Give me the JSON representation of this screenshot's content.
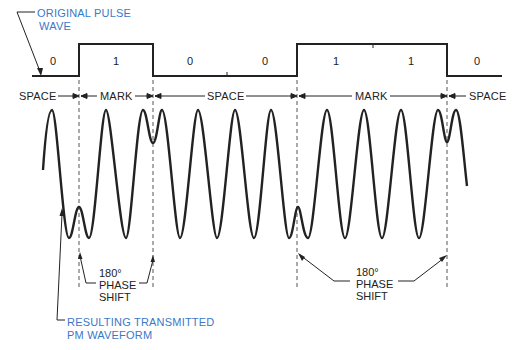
{
  "callouts": {
    "original": [
      "ORIGINAL PULSE",
      "WAVE"
    ],
    "resulting": [
      "RESULTING TRANSMITTED",
      "PM WAVEFORM"
    ]
  },
  "bits": [
    "0",
    "1",
    "0",
    "0",
    "1",
    "1",
    "0"
  ],
  "segments": [
    "SPACE",
    "MARK",
    "SPACE",
    "MARK",
    "SPACE"
  ],
  "phase_shift": {
    "left": [
      "180°",
      "PHASE",
      "SHIFT"
    ],
    "right": [
      "180°",
      "PHASE",
      "SHIFT"
    ]
  },
  "colors": {
    "callout": "#3a78c8",
    "line": "#222222"
  }
}
